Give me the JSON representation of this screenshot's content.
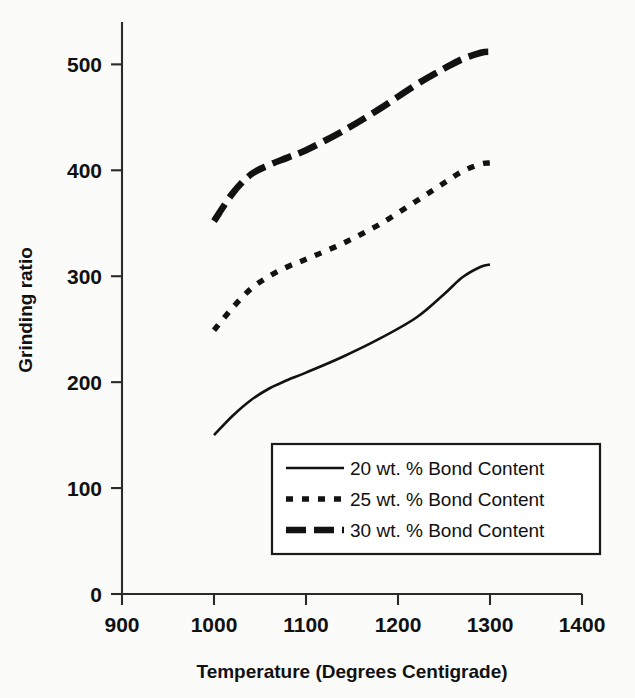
{
  "chart_data": {
    "type": "line",
    "title": "",
    "xlabel": "Temperature (Degrees Centigrade)",
    "ylabel": "Grinding ratio",
    "xlim": [
      900,
      1400
    ],
    "ylim": [
      0,
      540
    ],
    "xticks": [
      900,
      1000,
      1100,
      1200,
      1300,
      1400
    ],
    "xtick_labels": [
      "900",
      "1000",
      "1100",
      "1200",
      "1300",
      "1400"
    ],
    "yticks": [
      0,
      100,
      200,
      300,
      400,
      500
    ],
    "ytick_labels": [
      "0",
      "100",
      "200",
      "300",
      "400",
      "500"
    ],
    "grid": false,
    "legend_position": "inside-lower-right",
    "series": [
      {
        "name": "20 wt. % Bond Content",
        "style": "solid",
        "color": "#121212",
        "x": [
          1000,
          1020,
          1040,
          1060,
          1080,
          1100,
          1140,
          1180,
          1220,
          1250,
          1270,
          1290,
          1300
        ],
        "y": [
          150,
          168,
          183,
          194,
          202,
          209,
          224,
          241,
          261,
          283,
          299,
          309,
          311
        ]
      },
      {
        "name": "25 wt. % Bond Content",
        "style": "dotted",
        "color": "#121212",
        "x": [
          1000,
          1020,
          1040,
          1060,
          1080,
          1100,
          1140,
          1180,
          1220,
          1250,
          1270,
          1290,
          1300
        ],
        "y": [
          249,
          270,
          288,
          300,
          309,
          316,
          331,
          349,
          371,
          388,
          399,
          406,
          407
        ]
      },
      {
        "name": "30 wt. % Bond Content",
        "style": "dashed",
        "color": "#121212",
        "x": [
          1000,
          1020,
          1040,
          1060,
          1080,
          1100,
          1140,
          1180,
          1220,
          1250,
          1270,
          1290,
          1300
        ],
        "y": [
          352,
          378,
          396,
          405,
          412,
          419,
          437,
          458,
          481,
          496,
          505,
          511,
          512
        ]
      }
    ]
  },
  "legend": {
    "entries": [
      {
        "label": "20 wt. % Bond Content",
        "style": "solid"
      },
      {
        "label": "25 wt. % Bond Content",
        "style": "dotted"
      },
      {
        "label": "30 wt. % Bond Content",
        "style": "dashed"
      }
    ]
  },
  "colors": {
    "ink": "#121212",
    "axis": "#2a2a2a",
    "background": "#fbfbfa"
  }
}
